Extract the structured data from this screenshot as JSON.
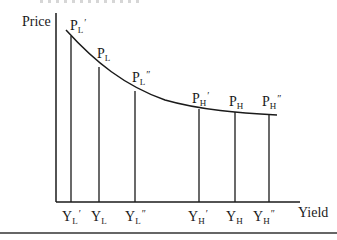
{
  "diagram": {
    "type": "price-yield curve",
    "y_axis_label": "Price",
    "x_axis_label": "Yield",
    "price_labels": [
      {
        "base": "P",
        "sub": "L",
        "prime": "′"
      },
      {
        "base": "P",
        "sub": "L",
        "prime": ""
      },
      {
        "base": "P",
        "sub": "L",
        "prime": "″"
      },
      {
        "base": "P",
        "sub": "H",
        "prime": "′"
      },
      {
        "base": "P",
        "sub": "H",
        "prime": ""
      },
      {
        "base": "P",
        "sub": "H",
        "prime": "″"
      }
    ],
    "yield_labels": [
      {
        "base": "Y",
        "sub": "L",
        "prime": "′"
      },
      {
        "base": "Y",
        "sub": "L",
        "prime": ""
      },
      {
        "base": "Y",
        "sub": "L",
        "prime": "″"
      },
      {
        "base": "Y",
        "sub": "H",
        "prime": "′"
      },
      {
        "base": "Y",
        "sub": "H",
        "prime": ""
      },
      {
        "base": "Y",
        "sub": "H",
        "prime": "″"
      }
    ]
  }
}
